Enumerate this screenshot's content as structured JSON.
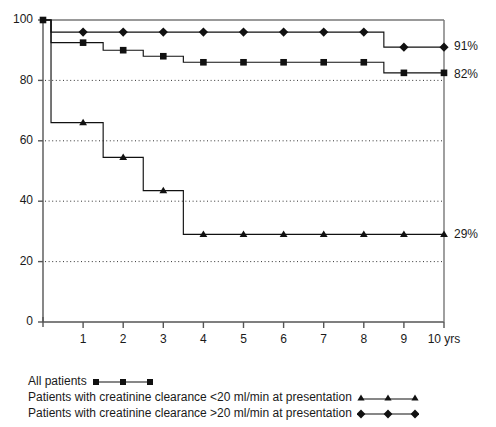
{
  "chart_data": {
    "type": "line",
    "subtype": "kaplan-meier step survival curves",
    "title": "",
    "xlabel": "",
    "ylabel": "",
    "xlim": [
      0,
      10
    ],
    "ylim": [
      0,
      100
    ],
    "x_unit": "yrs",
    "x_ticks": [
      0,
      1,
      2,
      3,
      4,
      5,
      6,
      7,
      8,
      9,
      10
    ],
    "x_tick_labels": [
      "0",
      "1",
      "2",
      "3",
      "4",
      "5",
      "6",
      "7",
      "8",
      "9",
      "10 yrs"
    ],
    "y_ticks": [
      0,
      20,
      40,
      60,
      80,
      100
    ],
    "y_tick_labels": [
      "0",
      "20",
      "40",
      "60",
      "80",
      "100"
    ],
    "gridlines": "dotted horizontal at 20, 40, 60, 80",
    "legend_position": "below-plot-left",
    "series": [
      {
        "name": "All patients",
        "marker": "square",
        "color": "#111111",
        "endpoint_label": "82%",
        "endpoint_value": 82,
        "steps": [
          {
            "x": 0.0,
            "y": 100
          },
          {
            "x": 0.2,
            "y": 92.5
          },
          {
            "x": 1.5,
            "y": 90.0
          },
          {
            "x": 2.5,
            "y": 88.0
          },
          {
            "x": 3.5,
            "y": 86.0
          },
          {
            "x": 8.5,
            "y": 82.5
          },
          {
            "x": 10.0,
            "y": 82.5
          }
        ],
        "marker_points": [
          {
            "x": 0.0,
            "y": 100
          },
          {
            "x": 1.0,
            "y": 92.5
          },
          {
            "x": 2.0,
            "y": 90.0
          },
          {
            "x": 3.0,
            "y": 88.0
          },
          {
            "x": 4.0,
            "y": 86.0
          },
          {
            "x": 5.0,
            "y": 86.0
          },
          {
            "x": 6.0,
            "y": 86.0
          },
          {
            "x": 7.0,
            "y": 86.0
          },
          {
            "x": 8.0,
            "y": 86.0
          },
          {
            "x": 9.0,
            "y": 82.5
          },
          {
            "x": 10.0,
            "y": 82.5
          }
        ]
      },
      {
        "name": "Patients with creatinine clearance <20 ml/min at presentation",
        "marker": "triangle",
        "color": "#111111",
        "endpoint_label": "29%",
        "endpoint_value": 29,
        "steps": [
          {
            "x": 0.0,
            "y": 100
          },
          {
            "x": 0.2,
            "y": 66.0
          },
          {
            "x": 1.5,
            "y": 54.5
          },
          {
            "x": 2.5,
            "y": 43.5
          },
          {
            "x": 3.5,
            "y": 29.0
          },
          {
            "x": 10.0,
            "y": 29.0
          }
        ],
        "marker_points": [
          {
            "x": 1.0,
            "y": 66.0
          },
          {
            "x": 2.0,
            "y": 54.5
          },
          {
            "x": 3.0,
            "y": 43.5
          },
          {
            "x": 4.0,
            "y": 29.0
          },
          {
            "x": 5.0,
            "y": 29.0
          },
          {
            "x": 6.0,
            "y": 29.0
          },
          {
            "x": 7.0,
            "y": 29.0
          },
          {
            "x": 8.0,
            "y": 29.0
          },
          {
            "x": 9.0,
            "y": 29.0
          },
          {
            "x": 10.0,
            "y": 29.0
          }
        ]
      },
      {
        "name": "Patients with creatinine clearance >20 ml/min at presentation",
        "marker": "diamond",
        "color": "#111111",
        "endpoint_label": "91%",
        "endpoint_value": 91,
        "steps": [
          {
            "x": 0.0,
            "y": 100
          },
          {
            "x": 0.2,
            "y": 96.0
          },
          {
            "x": 8.5,
            "y": 91.0
          },
          {
            "x": 10.0,
            "y": 91.0
          }
        ],
        "marker_points": [
          {
            "x": 1.0,
            "y": 96.0
          },
          {
            "x": 2.0,
            "y": 96.0
          },
          {
            "x": 3.0,
            "y": 96.0
          },
          {
            "x": 4.0,
            "y": 96.0
          },
          {
            "x": 5.0,
            "y": 96.0
          },
          {
            "x": 6.0,
            "y": 96.0
          },
          {
            "x": 7.0,
            "y": 96.0
          },
          {
            "x": 8.0,
            "y": 96.0
          },
          {
            "x": 9.0,
            "y": 91.0
          },
          {
            "x": 10.0,
            "y": 91.0
          }
        ]
      }
    ],
    "endpoint_labels": [
      "91%",
      "82%",
      "29%"
    ]
  },
  "legend": {
    "items": [
      {
        "label": "All patients",
        "marker": "square"
      },
      {
        "label": "Patients with creatinine clearance <20 ml/min at presentation",
        "marker": "triangle"
      },
      {
        "label": "Patients with creatinine clearance >20 ml/min at presentation",
        "marker": "diamond"
      }
    ]
  }
}
